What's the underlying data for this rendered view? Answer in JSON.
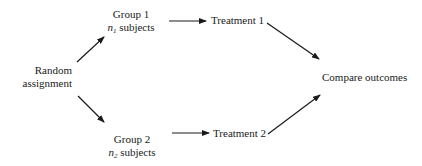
{
  "diagram": {
    "type": "flowchart",
    "nodes": {
      "random": {
        "line1": "Random",
        "line2": "assignment"
      },
      "group1": {
        "title": "Group 1",
        "count_var": "n",
        "count_sub": "1",
        "count_suffix": " subjects"
      },
      "group2": {
        "title": "Group 2",
        "count_var": "n",
        "count_sub": "2",
        "count_suffix": " subjects"
      },
      "treatment1": {
        "label": "Treatment 1"
      },
      "treatment2": {
        "label": "Treatment 2"
      },
      "compare": {
        "label": "Compare outcomes"
      }
    },
    "edges": [
      {
        "from": "Random assignment",
        "to": "Group 1"
      },
      {
        "from": "Random assignment",
        "to": "Group 2"
      },
      {
        "from": "Group 1",
        "to": "Treatment 1"
      },
      {
        "from": "Group 2",
        "to": "Treatment 2"
      },
      {
        "from": "Treatment 1",
        "to": "Compare outcomes"
      },
      {
        "from": "Treatment 2",
        "to": "Compare outcomes"
      }
    ],
    "colors": {
      "line": "#1a1a1a",
      "background": "#ffffff"
    }
  }
}
